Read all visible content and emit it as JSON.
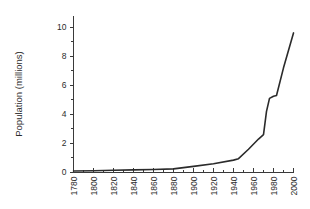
{
  "chart_data": {
    "type": "line",
    "title": "",
    "xlabel": "",
    "ylabel": "Population (millions)",
    "xlim": [
      1780,
      2000
    ],
    "ylim": [
      0,
      10.8
    ],
    "grid": false,
    "legend": null,
    "x_tick_labels": [
      "1780",
      "1800",
      "1820",
      "1840",
      "1860",
      "1880",
      "1900",
      "1920",
      "1940",
      "1960",
      "1980",
      "2000"
    ],
    "x_tick_values": [
      1780,
      1800,
      1820,
      1840,
      1860,
      1880,
      1900,
      1920,
      1940,
      1960,
      1980,
      2000
    ],
    "x_minor_interval": 10,
    "y_tick_labels": [
      "0",
      "2",
      "4",
      "6",
      "8",
      "10"
    ],
    "y_tick_values": [
      0,
      2,
      4,
      6,
      8,
      10
    ],
    "y_minor_values": [
      1,
      3,
      5,
      7,
      9
    ],
    "series": [
      {
        "name": "Population",
        "color": "#2b2b2b",
        "x": [
          1780,
          1800,
          1820,
          1840,
          1860,
          1880,
          1900,
          1920,
          1940,
          1945,
          1955,
          1965,
          1970,
          1973,
          1976,
          1980,
          1983,
          1990,
          2000
        ],
        "values": [
          0.1,
          0.12,
          0.15,
          0.18,
          0.21,
          0.25,
          0.42,
          0.6,
          0.85,
          0.95,
          1.6,
          2.3,
          2.6,
          4.2,
          5.1,
          5.25,
          5.3,
          7.2,
          9.6
        ]
      }
    ]
  }
}
